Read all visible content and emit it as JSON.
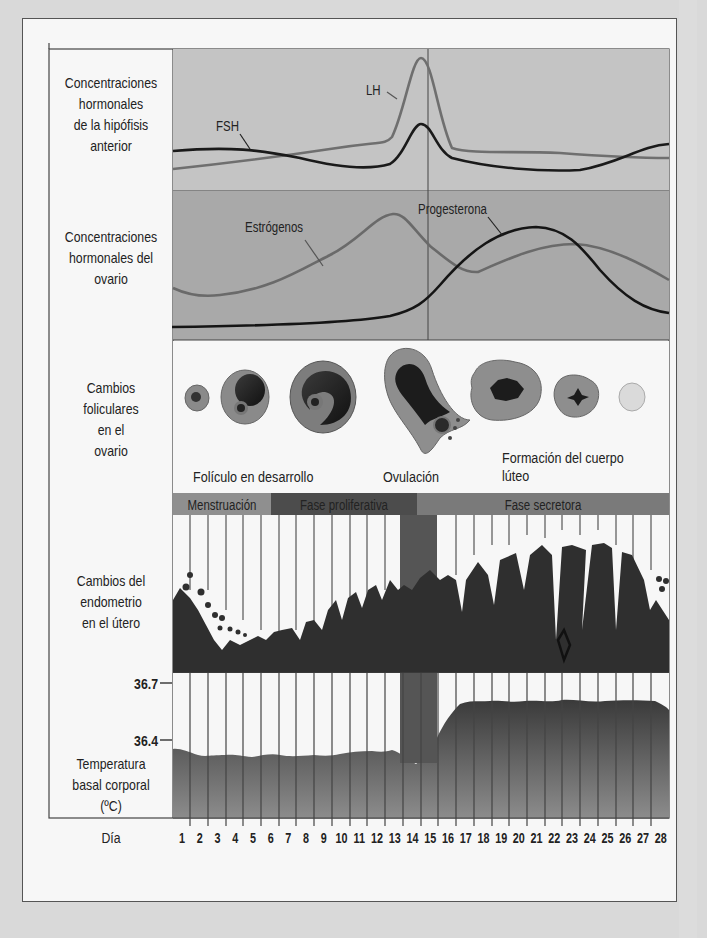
{
  "rows": {
    "pituitary": "Concentraciones\nhormonales\nde la hipófisis\nanterior",
    "ovary_hormones": "Concentraciones\nhormonales del\novario",
    "follicular": "Cambios\nfoliculares\nen el\novario",
    "endometrium": "Cambios del\nendometrio\nen el útero",
    "temperature": "Temperatura\nbasal corporal\n(ºC)"
  },
  "curve_labels": {
    "lh": "LH",
    "fsh": "FSH",
    "estrogen": "Estrógenos",
    "progesterone": "Progesterona"
  },
  "follicle_labels": {
    "developing": "Folículo en desarrollo",
    "ovulation": "Ovulación",
    "corpus_luteum_1": "Formación del cuerpo",
    "corpus_luteum_2": "lúteo"
  },
  "phases": [
    {
      "label": "Menstruación",
      "color": "#8f8f8f"
    },
    {
      "label": "Fase proliferativa",
      "color": "#4c4c4c"
    },
    {
      "label": "Fase secretora",
      "color": "#7a7a7a"
    }
  ],
  "temp_ticks": {
    "high": "36.7",
    "low": "36.4"
  },
  "x_axis_label": "Día",
  "days": [
    "1",
    "2",
    "3",
    "4",
    "5",
    "6",
    "7",
    "8",
    "9",
    "10",
    "11",
    "12",
    "13",
    "14",
    "15",
    "16",
    "17",
    "18",
    "19",
    "20",
    "21",
    "22",
    "23",
    "24",
    "25",
    "26",
    "27",
    "28"
  ],
  "chart_data": {
    "type": "line",
    "xlabel": "Día",
    "x": [
      1,
      2,
      3,
      4,
      5,
      6,
      7,
      8,
      9,
      10,
      11,
      12,
      13,
      14,
      15,
      16,
      17,
      18,
      19,
      20,
      21,
      22,
      23,
      24,
      25,
      26,
      27,
      28
    ],
    "panels": [
      {
        "name": "Concentraciones hormonales de la hipófisis anterior",
        "series": [
          {
            "name": "LH",
            "values": [
              2,
              2.2,
              2.4,
              2.6,
              2.8,
              3,
              3.2,
              3.4,
              3.6,
              3.8,
              4,
              4.4,
              6,
              10,
              6,
              3.3,
              3.2,
              3.2,
              3.2,
              3.2,
              3.2,
              3.2,
              3.1,
              3,
              3,
              2.9,
              2.8,
              2.8
            ]
          },
          {
            "name": "FSH",
            "values": [
              3,
              3.1,
              3.1,
              3.1,
              3,
              2.9,
              2.7,
              2.5,
              2.3,
              2.1,
              2,
              2,
              2.5,
              5,
              3,
              2.2,
              2,
              1.9,
              1.8,
              1.8,
              1.8,
              1.8,
              1.9,
              2.2,
              2.6,
              3,
              3.4,
              3.6
            ]
          }
        ]
      },
      {
        "name": "Concentraciones hormonales del ovario",
        "series": [
          {
            "name": "Estrógenos",
            "values": [
              3,
              2.6,
              2.5,
              2.6,
              2.9,
              3.3,
              3.8,
              4.3,
              5,
              5.9,
              7,
              8.5,
              8.8,
              7,
              5.5,
              4.4,
              4.2,
              4.8,
              5.4,
              5.9,
              6.2,
              6.3,
              6.2,
              5.9,
              5.3,
              4.6,
              3.8,
              3.2
            ]
          },
          {
            "name": "Progesterona",
            "values": [
              0.5,
              0.5,
              0.5,
              0.5,
              0.5,
              0.55,
              0.6,
              0.65,
              0.7,
              0.8,
              0.9,
              1.1,
              1.5,
              2.3,
              3.6,
              5,
              6.3,
              7.2,
              7.7,
              7.8,
              7.6,
              7,
              5.9,
              4.6,
              3.4,
              2.4,
              1.8,
              1.4
            ]
          }
        ]
      },
      {
        "name": "Temperatura basal corporal (ºC)",
        "ylim": [
          36.2,
          36.8
        ],
        "yticks": [
          36.4,
          36.7
        ],
        "series": [
          {
            "name": "Temperatura",
            "values": [
              36.45,
              36.41,
              36.4,
              36.41,
              36.4,
              36.42,
              36.4,
              36.4,
              36.41,
              36.4,
              36.42,
              36.43,
              36.43,
              36.4,
              36.36,
              36.48,
              36.65,
              36.69,
              36.69,
              36.68,
              36.68,
              36.69,
              36.67,
              36.69,
              36.68,
              36.68,
              36.69,
              36.66
            ]
          }
        ]
      }
    ],
    "phases": [
      {
        "label": "Menstruación",
        "days": [
          1,
          5
        ]
      },
      {
        "label": "Fase proliferativa",
        "days": [
          6,
          14
        ]
      },
      {
        "label": "Fase secretora",
        "days": [
          15,
          28
        ]
      }
    ],
    "ovulation_day": 14
  }
}
